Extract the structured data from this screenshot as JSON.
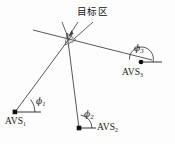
{
  "figure": {
    "title": "",
    "type": "schematic-diagram",
    "labels": {
      "target_area": "目标区",
      "avs1": "AVS",
      "avs1_sub": "1",
      "avs2": "AVS",
      "avs2_sub": "2",
      "avs3": "AVS",
      "avs3_sub": "3",
      "phi1": "ϕ",
      "phi1_sub": "1",
      "phi2": "ϕ",
      "phi2_sub": "2",
      "phi3": "ϕ",
      "phi3_sub": "3"
    },
    "colors": {
      "line": "#3a3a3a",
      "node": "#111111",
      "background": "#fdfdfd",
      "target_fill": "#9a9a9a"
    },
    "nodes": [
      {
        "name": "AVS1",
        "x": 15,
        "y": 112
      },
      {
        "name": "AVS2",
        "x": 79,
        "y": 128
      },
      {
        "name": "AVS3",
        "x": 141,
        "y": 62
      },
      {
        "name": "target",
        "x": 70,
        "y": 38
      }
    ],
    "bearing_lines": [
      {
        "from": "AVS1",
        "to": "target",
        "x1": 15,
        "y1": 112,
        "x2": 71,
        "y2": 37
      },
      {
        "from": "AVS2",
        "to": "target",
        "x1": 79,
        "y1": 128,
        "x2": 68,
        "y2": 35
      },
      {
        "from": "AVS3",
        "to": "target",
        "x1": 152,
        "y1": 60,
        "x2": 33,
        "y2": 30
      }
    ],
    "angle_arcs": [
      {
        "name": "phi1",
        "vertex_x": 15,
        "vertex_y": 112,
        "radius": 20
      },
      {
        "name": "phi2",
        "vertex_x": 79,
        "vertex_y": 128,
        "radius": 14
      },
      {
        "name": "phi3",
        "vertex_x": 141,
        "vertex_y": 62,
        "radius": 13
      }
    ],
    "leader_lines": [
      {
        "from_x": 80,
        "from_y": 21,
        "to_x": 70,
        "to_y": 37
      },
      {
        "from_x": 92,
        "from_y": 21,
        "to_x": 74,
        "to_y": 38
      }
    ]
  }
}
